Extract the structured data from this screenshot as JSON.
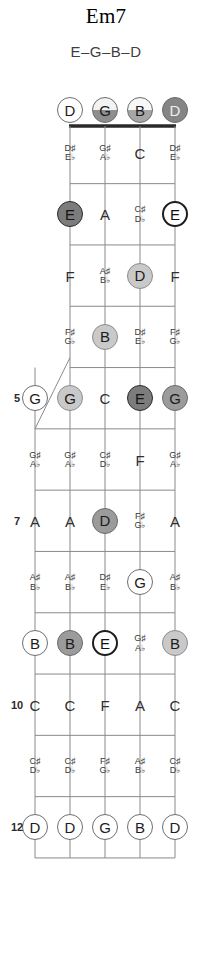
{
  "header": {
    "chord_name": "Em7",
    "chord_notes": "E–G–B–D"
  },
  "fretboard": {
    "instrument": "5-string banjo",
    "string_count": 5,
    "fifth_string_starts_at_fret": 5,
    "fret_markers": [
      "5",
      "7",
      "10",
      "12"
    ],
    "open_strings": [
      {
        "label": "D",
        "style": "open"
      },
      {
        "label": "G",
        "style": "shade"
      },
      {
        "label": "B",
        "style": "shade2"
      },
      {
        "label": "D",
        "style": "solid"
      }
    ],
    "colors": {
      "root_dark": "#7c7c7c",
      "chord_mid": "#9b9b9b",
      "chord_light": "#c9c9c9",
      "line": "#8a8a8a",
      "nut": "#2a2a2a"
    },
    "rows": [
      {
        "fret": "1",
        "cells": [
          {
            "kind": "none"
          },
          {
            "kind": "acc",
            "sharp": "D♯",
            "flat": "E♭"
          },
          {
            "kind": "acc",
            "sharp": "G♯",
            "flat": "A♭"
          },
          {
            "kind": "plain",
            "label": "C"
          },
          {
            "kind": "acc",
            "sharp": "D♯",
            "flat": "E♭"
          }
        ]
      },
      {
        "fret": "2",
        "cells": [
          {
            "kind": "none"
          },
          {
            "kind": "dot",
            "label": "E",
            "style": "root"
          },
          {
            "kind": "plain",
            "label": "A"
          },
          {
            "kind": "acc",
            "sharp": "C♯",
            "flat": "D♭"
          },
          {
            "kind": "dot",
            "label": "E",
            "style": "rootb"
          }
        ]
      },
      {
        "fret": "3",
        "cells": [
          {
            "kind": "none"
          },
          {
            "kind": "plain",
            "label": "F"
          },
          {
            "kind": "acc",
            "sharp": "A♯",
            "flat": "B♭"
          },
          {
            "kind": "dot",
            "label": "D",
            "style": "light"
          },
          {
            "kind": "plain",
            "label": "F"
          }
        ]
      },
      {
        "fret": "4",
        "cells": [
          {
            "kind": "none"
          },
          {
            "kind": "acc",
            "sharp": "F♯",
            "flat": "G♭"
          },
          {
            "kind": "dot",
            "label": "B",
            "style": "light"
          },
          {
            "kind": "acc",
            "sharp": "D♯",
            "flat": "E♭"
          },
          {
            "kind": "acc",
            "sharp": "F♯",
            "flat": "G♭"
          }
        ]
      },
      {
        "fret": "5",
        "cells": [
          {
            "kind": "dot",
            "label": "G",
            "style": "open"
          },
          {
            "kind": "dot",
            "label": "G",
            "style": "light"
          },
          {
            "kind": "plain",
            "label": "C"
          },
          {
            "kind": "dot",
            "label": "E",
            "style": "root"
          },
          {
            "kind": "dot",
            "label": "G",
            "style": "mid"
          }
        ]
      },
      {
        "fret": "6",
        "cells": [
          {
            "kind": "acc",
            "sharp": "G♯",
            "flat": "A♭"
          },
          {
            "kind": "acc",
            "sharp": "G♯",
            "flat": "A♭"
          },
          {
            "kind": "acc",
            "sharp": "C♯",
            "flat": "D♭"
          },
          {
            "kind": "plain",
            "label": "F"
          },
          {
            "kind": "acc",
            "sharp": "G♯",
            "flat": "A♭"
          }
        ]
      },
      {
        "fret": "7",
        "cells": [
          {
            "kind": "plain",
            "label": "A"
          },
          {
            "kind": "plain",
            "label": "A"
          },
          {
            "kind": "dot",
            "label": "D",
            "style": "mid"
          },
          {
            "kind": "acc",
            "sharp": "F♯",
            "flat": "G♭"
          },
          {
            "kind": "plain",
            "label": "A"
          }
        ]
      },
      {
        "fret": "8",
        "cells": [
          {
            "kind": "acc",
            "sharp": "A♯",
            "flat": "B♭"
          },
          {
            "kind": "acc",
            "sharp": "A♯",
            "flat": "B♭"
          },
          {
            "kind": "acc",
            "sharp": "D♯",
            "flat": "E♭"
          },
          {
            "kind": "dot",
            "label": "G",
            "style": "open"
          },
          {
            "kind": "acc",
            "sharp": "A♯",
            "flat": "B♭"
          }
        ]
      },
      {
        "fret": "9",
        "cells": [
          {
            "kind": "dot",
            "label": "B",
            "style": "open"
          },
          {
            "kind": "dot",
            "label": "B",
            "style": "mid"
          },
          {
            "kind": "dot",
            "label": "E",
            "style": "rootb"
          },
          {
            "kind": "acc",
            "sharp": "G♯",
            "flat": "A♭"
          },
          {
            "kind": "dot",
            "label": "B",
            "style": "light"
          }
        ]
      },
      {
        "fret": "10",
        "cells": [
          {
            "kind": "plain",
            "label": "C"
          },
          {
            "kind": "plain",
            "label": "C"
          },
          {
            "kind": "plain",
            "label": "F"
          },
          {
            "kind": "plain",
            "label": "A"
          },
          {
            "kind": "plain",
            "label": "C"
          }
        ]
      },
      {
        "fret": "11",
        "cells": [
          {
            "kind": "acc",
            "sharp": "C♯",
            "flat": "D♭"
          },
          {
            "kind": "acc",
            "sharp": "C♯",
            "flat": "D♭"
          },
          {
            "kind": "acc",
            "sharp": "F♯",
            "flat": "G♭"
          },
          {
            "kind": "acc",
            "sharp": "A♯",
            "flat": "B♭"
          },
          {
            "kind": "acc",
            "sharp": "C♯",
            "flat": "D♭"
          }
        ]
      },
      {
        "fret": "12",
        "cells": [
          {
            "kind": "dot",
            "label": "D",
            "style": "open"
          },
          {
            "kind": "dot",
            "label": "D",
            "style": "open"
          },
          {
            "kind": "dot",
            "label": "G",
            "style": "open"
          },
          {
            "kind": "dot",
            "label": "B",
            "style": "open"
          },
          {
            "kind": "dot",
            "label": "D",
            "style": "open"
          }
        ]
      }
    ]
  }
}
